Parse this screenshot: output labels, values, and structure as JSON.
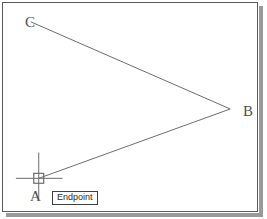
{
  "app": {
    "view_name": "cad-drawing-canvas",
    "background_color": "#ffffff",
    "frame_border_color": "#5a5a5a",
    "shadow_color": "#9a9a9a",
    "geometry_color": "#6b6b6b",
    "cursor_color": "#6b6b6b"
  },
  "drawing": {
    "labels": {
      "c": "C",
      "b": "B",
      "a": "A"
    },
    "vertices": {
      "c": {
        "x": 31,
        "y": 22
      },
      "b": {
        "x": 232,
        "y": 110
      },
      "a": {
        "x": 39,
        "y": 180
      }
    },
    "segments": [
      {
        "name": "segment-cb",
        "from": "C",
        "to": "B"
      },
      {
        "name": "segment-ba",
        "from": "B",
        "to": "A"
      }
    ]
  },
  "cursor": {
    "name": "crosshair-cursor",
    "center": {
      "x": 39,
      "y": 180
    },
    "vertical_line": {
      "x": 39,
      "y1": 154,
      "y2": 202
    },
    "horizontal_line": {
      "y": 180,
      "x1": 16,
      "x2": 63
    },
    "snap_marker": {
      "name": "endpoint-snap-marker",
      "shape": "square",
      "x": 34,
      "y": 175,
      "size": 10
    }
  },
  "tooltip": {
    "name": "object-snap-tooltip",
    "text": "Endpoint",
    "border_color": "#3f3f3f",
    "background_color": "#ffffff"
  }
}
